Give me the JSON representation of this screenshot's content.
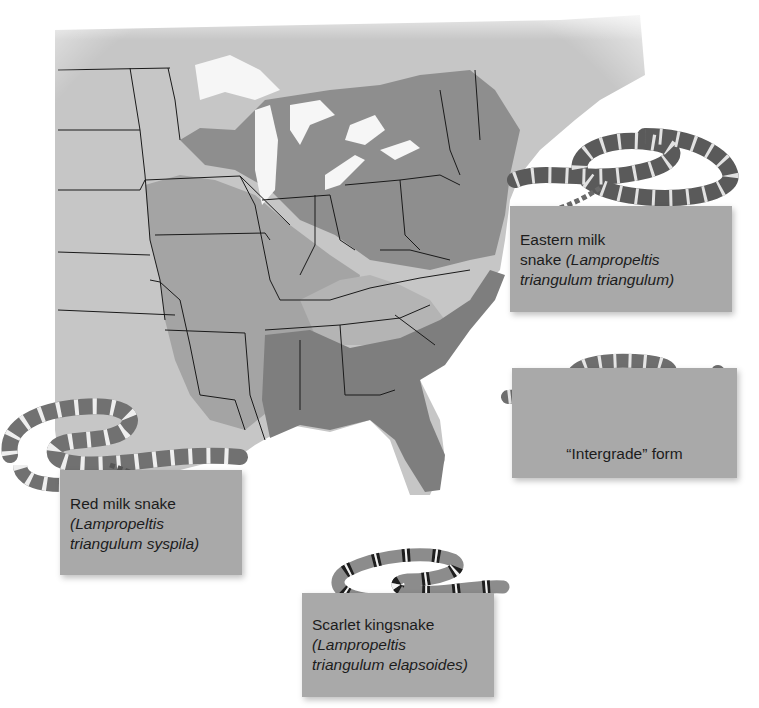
{
  "figure": {
    "type": "range-map",
    "region": "Eastern United States",
    "colors": {
      "background": "#ffffff",
      "land_outside_range": "#c4c4c4",
      "range_eastern_milk": "#8e8e8e",
      "range_red_milk": "#a2a2a2",
      "range_scarlet": "#7c7c7c",
      "intergrade_zone": "#b3b3b3",
      "water": "#f4f4f4",
      "borders": "#1a1a1a",
      "label_box": "#a9a9a9",
      "label_text": "#1c1c1c"
    }
  },
  "labels": {
    "eastern": {
      "common": "Eastern milk snake",
      "common_line1": "Eastern milk",
      "common_line2": "snake",
      "sci_open": "(Lampropeltis",
      "sci_close": "triangulum triangulum)"
    },
    "intergrade": {
      "common": "“Intergrade” form"
    },
    "red": {
      "common": "Red milk snake",
      "sci_open": "(Lampropeltis",
      "sci_close": "triangulum syspila)"
    },
    "scarlet": {
      "common": "Scarlet kingsnake",
      "sci_open": "(Lampropeltis",
      "sci_close": "triangulum elapsoides)"
    }
  },
  "snakes": [
    {
      "name": "eastern-milk-snake",
      "pattern": "dark saddles, light borders"
    },
    {
      "name": "intergrade-snake",
      "pattern": "mid saddles, light bands"
    },
    {
      "name": "red-milk-snake",
      "pattern": "red saddles, white bands"
    },
    {
      "name": "scarlet-kingsnake",
      "pattern": "red-black-white rings"
    }
  ]
}
